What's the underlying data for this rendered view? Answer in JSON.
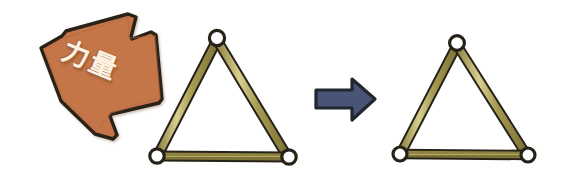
{
  "figure": {
    "background_color": "#ffffff",
    "width": 568,
    "height": 191
  },
  "force_arrow": {
    "label": "力量",
    "label_meaning": "force",
    "fill_color": "#c4764a",
    "outline_color": "#2a2119",
    "label_color": "#fdf3e2",
    "direction": "down-right",
    "rotation_deg": 22
  },
  "transition_arrow": {
    "name": "right-arrow-icon",
    "fill_color": "#4a5478",
    "outline_color": "#21262f",
    "direction": "right"
  },
  "truss_before": {
    "name": "triangle-truss-before",
    "bar_fill_color": "#a3974f",
    "bar_highlight_color": "#d6cd8e",
    "bar_outline_color": "#262218",
    "joint_fill_color": "#ffffff",
    "joint_outline_color": "#262218",
    "joint_count": 3,
    "bar_count": 3,
    "vertices": [
      {
        "name": "apex",
        "x": 217,
        "y": 38
      },
      {
        "name": "bottom-left",
        "x": 157,
        "y": 156
      },
      {
        "name": "bottom-right",
        "x": 288,
        "y": 157
      }
    ]
  },
  "truss_after": {
    "name": "triangle-truss-after",
    "bar_fill_color": "#a3974f",
    "bar_highlight_color": "#d6cd8e",
    "bar_outline_color": "#262218",
    "joint_fill_color": "#ffffff",
    "joint_outline_color": "#262218",
    "joint_count": 3,
    "bar_count": 3,
    "vertices": [
      {
        "name": "apex",
        "x": 457,
        "y": 43
      },
      {
        "name": "bottom-left",
        "x": 400,
        "y": 154
      },
      {
        "name": "bottom-right",
        "x": 527,
        "y": 155
      }
    ]
  }
}
